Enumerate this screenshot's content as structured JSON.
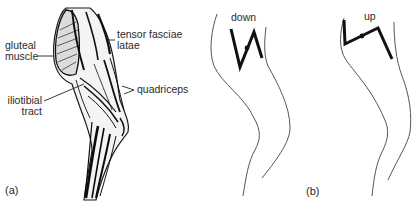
{
  "figure": {
    "panel_a": {
      "caption": "(a)",
      "labels": {
        "gluteal_line1": "gluteal",
        "gluteal_line2": "muscle",
        "tensor_line1": "tensor fasciae",
        "tensor_line2": "latae",
        "quadriceps": "quadriceps",
        "iliotibial_line1": "iliotibial",
        "iliotibial_line2": "tract"
      }
    },
    "panel_b": {
      "caption": "(b)",
      "left_leg": {
        "label": "down"
      },
      "right_leg": {
        "label": "up"
      }
    },
    "colors": {
      "ink": "#1a1a1a",
      "outline": "#555555",
      "background": "#ffffff"
    }
  }
}
